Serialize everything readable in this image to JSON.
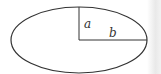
{
  "diagram": {
    "type": "ellipse-semi-axes",
    "shape": "ellipse",
    "labels": {
      "vertical_semi_axis": "a",
      "horizontal_semi_axis": "b"
    },
    "colors": {
      "stroke": "#333333",
      "background": "#ffffff"
    }
  }
}
